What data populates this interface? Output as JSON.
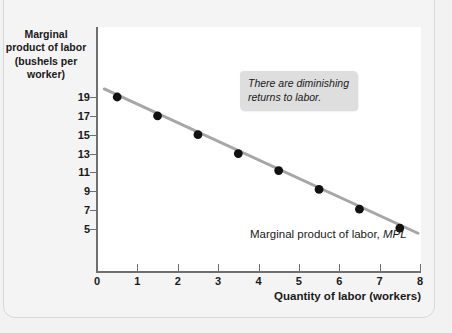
{
  "chart_data": {
    "type": "scatter",
    "title": "",
    "xlabel": "Quantity of labor (workers)",
    "ylabel": "Marginal product of labor (bushels per worker)",
    "ylabel_lines": [
      "Marginal",
      "product of labor",
      "(bushels per",
      "worker)"
    ],
    "xlim": [
      0,
      8
    ],
    "ylim": [
      0,
      20
    ],
    "grid": false,
    "legend_position": "inline-right",
    "x_ticks": [
      "0",
      "1",
      "2",
      "3",
      "4",
      "5",
      "6",
      "7",
      "8"
    ],
    "x_tick_values": [
      0,
      1,
      2,
      3,
      4,
      5,
      6,
      7,
      8
    ],
    "y_ticks": [
      "5",
      "7",
      "9",
      "11",
      "13",
      "15",
      "17",
      "19"
    ],
    "y_tick_values": [
      5,
      7,
      9,
      11,
      13,
      15,
      17,
      19
    ],
    "x": [
      0.5,
      1.5,
      2.5,
      3.5,
      4.5,
      5.5,
      6.5,
      7.5
    ],
    "values": [
      19,
      17,
      15,
      13,
      11.2,
      9.2,
      7.1,
      5.1
    ],
    "series": [
      {
        "name": "Marginal product of labor, MPL",
        "x": [
          0.5,
          1.5,
          2.5,
          3.5,
          4.5,
          5.5,
          6.5,
          7.5
        ],
        "values": [
          19,
          17,
          15,
          13,
          11.2,
          9.2,
          7.1,
          5.1
        ],
        "marker_color": "#111111",
        "line_color": "#a6a6a6"
      }
    ],
    "trend_line": {
      "x_start": 0.18,
      "y_start": 19.85,
      "x_end": 7.95,
      "y_end": 4.55
    },
    "annotations": [
      {
        "text": "There are diminishing\nreturns to labor.",
        "x": 3.5,
        "y": 16.6,
        "style": "italic",
        "background": "#dedede"
      }
    ],
    "series_label": {
      "prefix": "Marginal product of labor, ",
      "emphasis": "MPL"
    }
  },
  "colors": {
    "page_background": "#f2f2f2",
    "card_background": "#f4f4f4",
    "plot_background": "#ffffff",
    "axis": "#6f6f6f",
    "text": "#1a1a1a",
    "line": "#a6a6a6",
    "marker": "#111111",
    "annotation_background": "#dedede"
  }
}
